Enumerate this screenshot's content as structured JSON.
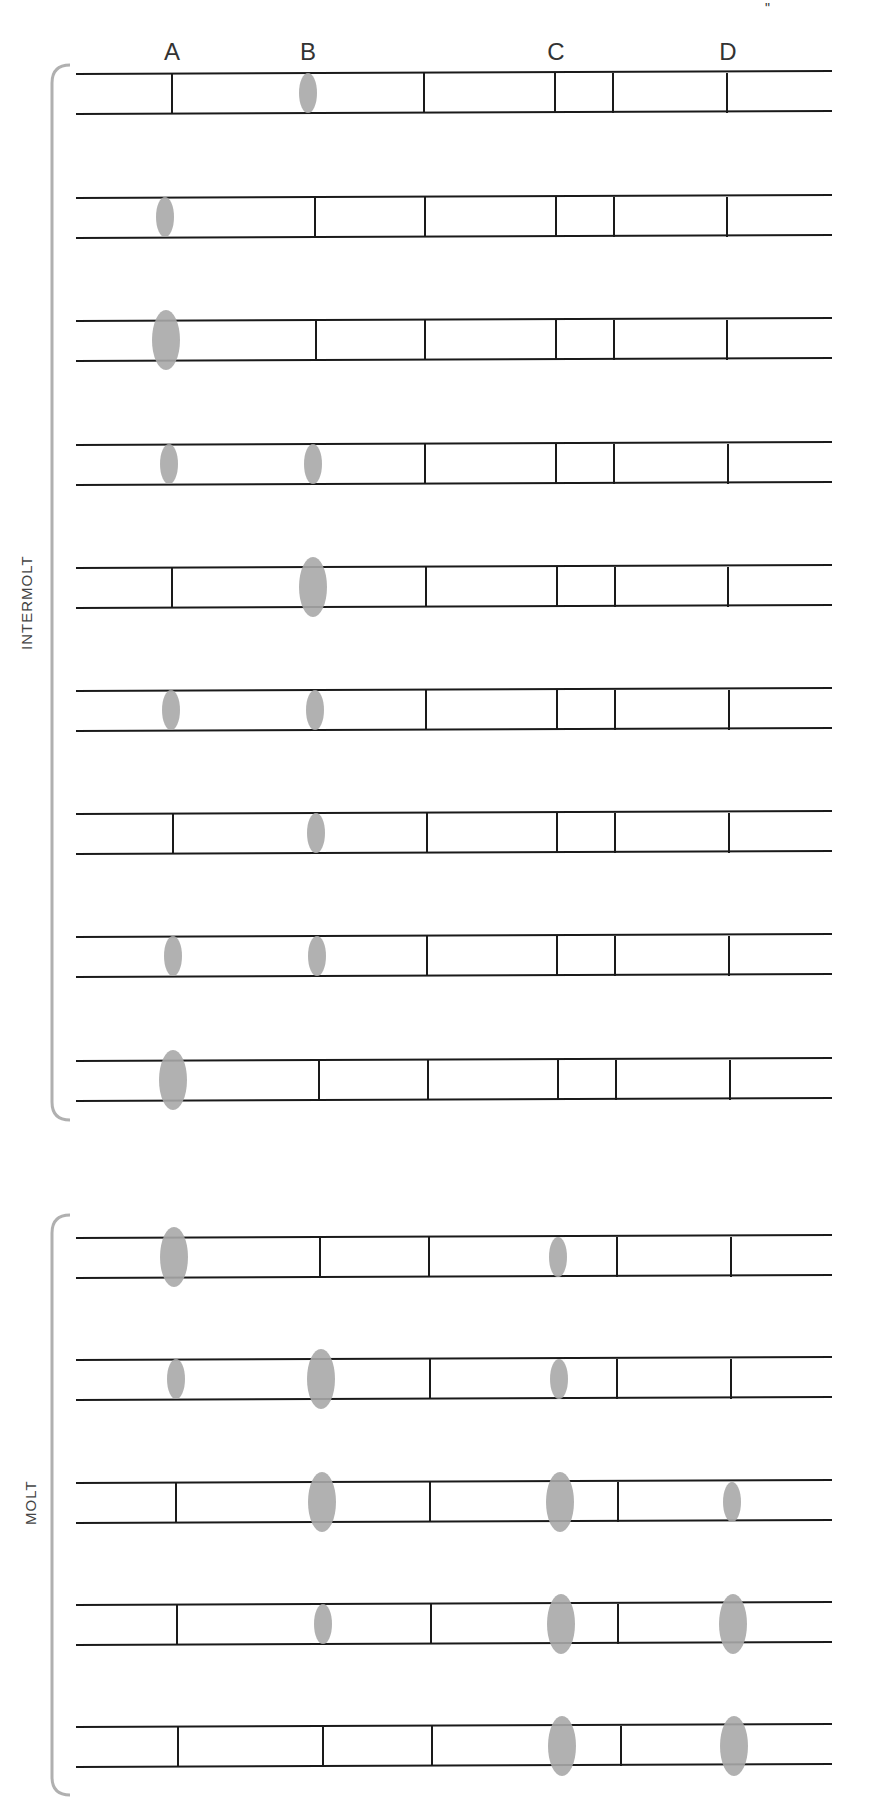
{
  "columns": [
    {
      "label": "A",
      "x": 172
    },
    {
      "label": "B",
      "x": 308
    },
    {
      "label": "C",
      "x": 556
    },
    {
      "label": "D",
      "x": 728
    }
  ],
  "corner_mark": "\"",
  "groups": [
    {
      "label": "INTERMOLT",
      "label_x": 18,
      "label_y": 650,
      "bracket_top": 65,
      "bracket_bottom": 1120
    },
    {
      "label": "MOLT",
      "label_x": 22,
      "label_y": 1525,
      "bracket_top": 1215,
      "bracket_bottom": 1795
    }
  ],
  "strip": {
    "x_start": 76,
    "x_end": 832,
    "height": 40
  },
  "rows": [
    {
      "group": "INTERMOLT",
      "y": 73,
      "cells": [
        {
          "x": 172,
          "type": "bar"
        },
        {
          "x": 308,
          "type": "spot",
          "size": "m"
        },
        {
          "x": 424,
          "type": "bar"
        },
        {
          "x": 555,
          "type": "bar"
        },
        {
          "x": 613,
          "type": "bar"
        },
        {
          "x": 727,
          "type": "bar"
        }
      ]
    },
    {
      "group": "INTERMOLT",
      "y": 197,
      "cells": [
        {
          "x": 165,
          "type": "spot",
          "size": "m"
        },
        {
          "x": 315,
          "type": "bar"
        },
        {
          "x": 425,
          "type": "bar"
        },
        {
          "x": 556,
          "type": "bar"
        },
        {
          "x": 614,
          "type": "bar"
        },
        {
          "x": 727,
          "type": "bar"
        }
      ]
    },
    {
      "group": "INTERMOLT",
      "y": 320,
      "cells": [
        {
          "x": 166,
          "type": "spot",
          "size": "l"
        },
        {
          "x": 316,
          "type": "bar"
        },
        {
          "x": 425,
          "type": "bar"
        },
        {
          "x": 556,
          "type": "bar"
        },
        {
          "x": 614,
          "type": "bar"
        },
        {
          "x": 727,
          "type": "bar"
        }
      ]
    },
    {
      "group": "INTERMOLT",
      "y": 444,
      "cells": [
        {
          "x": 169,
          "type": "spot",
          "size": "m"
        },
        {
          "x": 313,
          "type": "spot",
          "size": "m"
        },
        {
          "x": 425,
          "type": "bar"
        },
        {
          "x": 556,
          "type": "bar"
        },
        {
          "x": 614,
          "type": "bar"
        },
        {
          "x": 728,
          "type": "bar"
        }
      ]
    },
    {
      "group": "INTERMOLT",
      "y": 567,
      "cells": [
        {
          "x": 172,
          "type": "bar"
        },
        {
          "x": 313,
          "type": "spot",
          "size": "l"
        },
        {
          "x": 426,
          "type": "bar"
        },
        {
          "x": 557,
          "type": "bar"
        },
        {
          "x": 615,
          "type": "bar"
        },
        {
          "x": 728,
          "type": "bar"
        }
      ]
    },
    {
      "group": "INTERMOLT",
      "y": 690,
      "cells": [
        {
          "x": 171,
          "type": "spot",
          "size": "m"
        },
        {
          "x": 315,
          "type": "spot",
          "size": "m"
        },
        {
          "x": 426,
          "type": "bar"
        },
        {
          "x": 557,
          "type": "bar"
        },
        {
          "x": 615,
          "type": "bar"
        },
        {
          "x": 729,
          "type": "bar"
        }
      ]
    },
    {
      "group": "INTERMOLT",
      "y": 813,
      "cells": [
        {
          "x": 173,
          "type": "bar"
        },
        {
          "x": 316,
          "type": "spot",
          "size": "m"
        },
        {
          "x": 427,
          "type": "bar"
        },
        {
          "x": 557,
          "type": "bar"
        },
        {
          "x": 615,
          "type": "bar"
        },
        {
          "x": 729,
          "type": "bar"
        }
      ]
    },
    {
      "group": "INTERMOLT",
      "y": 936,
      "cells": [
        {
          "x": 173,
          "type": "spot",
          "size": "m"
        },
        {
          "x": 317,
          "type": "spot",
          "size": "m"
        },
        {
          "x": 427,
          "type": "bar"
        },
        {
          "x": 557,
          "type": "bar"
        },
        {
          "x": 615,
          "type": "bar"
        },
        {
          "x": 729,
          "type": "bar"
        }
      ]
    },
    {
      "group": "INTERMOLT",
      "y": 1060,
      "cells": [
        {
          "x": 173,
          "type": "spot",
          "size": "l"
        },
        {
          "x": 319,
          "type": "bar"
        },
        {
          "x": 428,
          "type": "bar"
        },
        {
          "x": 558,
          "type": "bar"
        },
        {
          "x": 616,
          "type": "bar"
        },
        {
          "x": 730,
          "type": "bar"
        }
      ]
    },
    {
      "group": "MOLT",
      "y": 1237,
      "cells": [
        {
          "x": 174,
          "type": "spot",
          "size": "l"
        },
        {
          "x": 320,
          "type": "bar"
        },
        {
          "x": 429,
          "type": "bar"
        },
        {
          "x": 558,
          "type": "spot",
          "size": "m"
        },
        {
          "x": 617,
          "type": "bar"
        },
        {
          "x": 731,
          "type": "bar"
        }
      ]
    },
    {
      "group": "MOLT",
      "y": 1359,
      "cells": [
        {
          "x": 176,
          "type": "spot",
          "size": "m"
        },
        {
          "x": 321,
          "type": "spot",
          "size": "l"
        },
        {
          "x": 430,
          "type": "bar"
        },
        {
          "x": 559,
          "type": "spot",
          "size": "m"
        },
        {
          "x": 617,
          "type": "bar"
        },
        {
          "x": 731,
          "type": "bar"
        }
      ]
    },
    {
      "group": "MOLT",
      "y": 1482,
      "cells": [
        {
          "x": 176,
          "type": "bar"
        },
        {
          "x": 322,
          "type": "spot",
          "size": "l"
        },
        {
          "x": 430,
          "type": "bar"
        },
        {
          "x": 560,
          "type": "spot",
          "size": "l"
        },
        {
          "x": 618,
          "type": "bar"
        },
        {
          "x": 732,
          "type": "spot",
          "size": "m"
        }
      ]
    },
    {
      "group": "MOLT",
      "y": 1604,
      "cells": [
        {
          "x": 177,
          "type": "bar"
        },
        {
          "x": 323,
          "type": "spot",
          "size": "m"
        },
        {
          "x": 431,
          "type": "bar"
        },
        {
          "x": 561,
          "type": "spot",
          "size": "l"
        },
        {
          "x": 618,
          "type": "bar"
        },
        {
          "x": 733,
          "type": "spot",
          "size": "l"
        }
      ]
    },
    {
      "group": "MOLT",
      "y": 1726,
      "cells": [
        {
          "x": 178,
          "type": "bar"
        },
        {
          "x": 323,
          "type": "bar"
        },
        {
          "x": 432,
          "type": "bar"
        },
        {
          "x": 562,
          "type": "spot",
          "size": "l"
        },
        {
          "x": 621,
          "type": "bar"
        },
        {
          "x": 734,
          "type": "spot",
          "size": "l"
        }
      ]
    }
  ],
  "colors": {
    "line": "#1a1a1a",
    "spot": "#a8a8a8",
    "bracket": "#b0b0b0",
    "text": "#333333"
  }
}
